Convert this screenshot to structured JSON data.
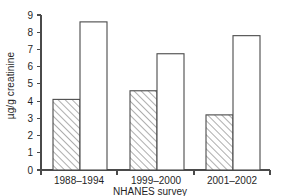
{
  "chart_data": {
    "type": "bar",
    "title": "",
    "subtitle": "",
    "xlabel": "NHANES survey",
    "ylabel": "µg/g creatinine",
    "categories": [
      "1988–1994",
      "1999–2000",
      "2001–2002"
    ],
    "series": [
      {
        "name": "hatched",
        "style": "diagonal-hatch",
        "values": [
          4.1,
          4.6,
          3.2
        ]
      },
      {
        "name": "open",
        "style": "open-white",
        "values": [
          8.6,
          6.75,
          7.8
        ]
      }
    ],
    "ylim": [
      0,
      9
    ],
    "ytick_labels": [
      "0",
      "1",
      "2",
      "3",
      "4",
      "5",
      "6",
      "7",
      "8",
      "9"
    ],
    "ytick_values": [
      0,
      1,
      2,
      3,
      4,
      5,
      6,
      7,
      8,
      9
    ],
    "grid": false,
    "legend": false,
    "legend_position": "none",
    "annotations": [],
    "colors": {
      "axis": "#4a4a4a",
      "bar_outline": "#4a4a4a",
      "bar_open_fill": "#ffffff",
      "hatch_line": "#6b6b6b",
      "background": "#ffffff",
      "text": "#1f1f1f"
    }
  }
}
